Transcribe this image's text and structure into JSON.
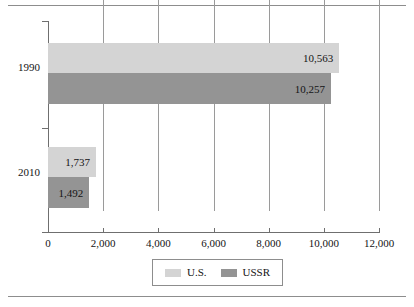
{
  "chart_data": {
    "type": "bar",
    "orientation": "horizontal",
    "title": "",
    "subtitle": "",
    "xlabel": "",
    "ylabel": "",
    "categories": [
      "1990",
      "2010"
    ],
    "series": [
      {
        "name": "U.S.",
        "color": "#d4d4d4",
        "values": [
          10563,
          1737
        ],
        "labels": [
          "10,563",
          "1,737"
        ]
      },
      {
        "name": "USSR",
        "color": "#949494",
        "values": [
          10257,
          1492
        ],
        "labels": [
          "10,257",
          "1,492"
        ]
      }
    ],
    "xlim": [
      0,
      12000
    ],
    "xticks": [
      0,
      2000,
      4000,
      6000,
      8000,
      10000,
      12000
    ],
    "xtick_labels": [
      "0",
      "2,000",
      "4,000",
      "6,000",
      "8,000",
      "10,000",
      "12,000"
    ],
    "grid": true,
    "grid_axis": "x",
    "legend": {
      "position": "bottom",
      "entries": [
        {
          "label": "U.S.",
          "swatch": "legend-swatch-us"
        },
        {
          "label": "USSR",
          "swatch": "legend-swatch-ussr"
        }
      ]
    },
    "colors": {
      "series_us": "#d4d4d4",
      "series_ussr": "#949494",
      "gridline": "#9a9a9a",
      "axis": "#6f6f6f",
      "rule": "#8d8d8d",
      "text": "#141414",
      "background": "#ffffff"
    }
  }
}
